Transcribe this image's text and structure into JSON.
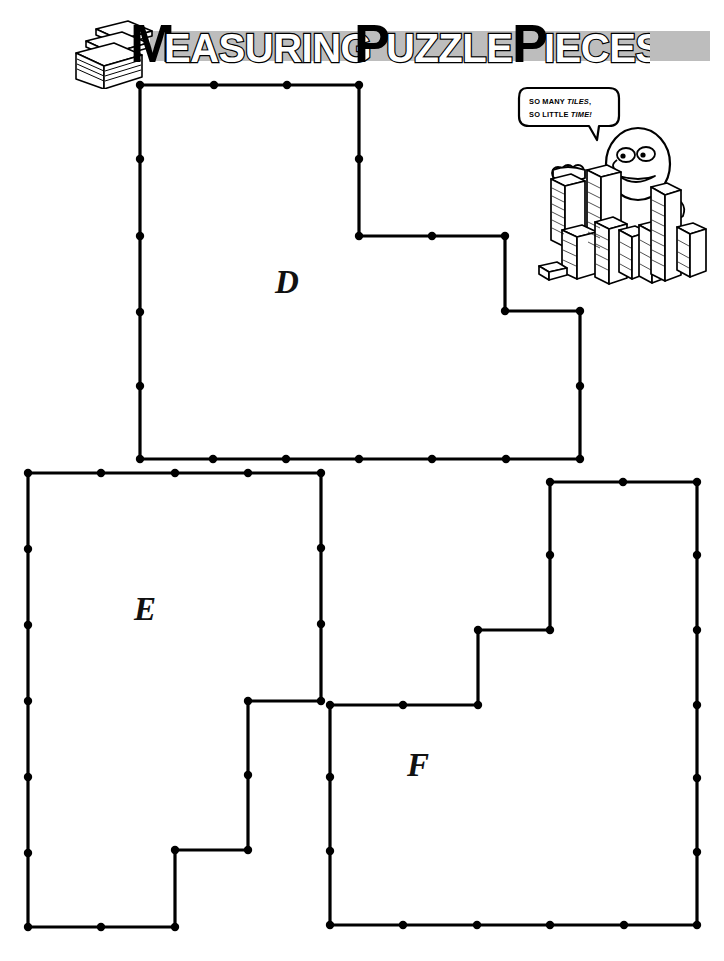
{
  "page": {
    "background_color": "#ffffff",
    "ink_color": "#000000",
    "band_color": "#bdbdbd",
    "width": 724,
    "height": 961
  },
  "header": {
    "title_words": [
      {
        "cap": "M",
        "rest": "EASURING"
      },
      {
        "cap": "P",
        "rest": "UZZLE"
      },
      {
        "cap": "P",
        "rest": "IECES"
      }
    ],
    "title_plain": "MEASURING PUZZLE PIECES",
    "logo_icon": "stack-of-tiles-icon"
  },
  "cartoon": {
    "speech_line1_plain": "SO MANY TILES,",
    "speech_line2_plain": "SO LITTLE TIME!",
    "speech_line1": {
      "a": "SO MANY ",
      "b": "TILES",
      "c": ","
    },
    "speech_line2": {
      "a": "SO LITTLE ",
      "b": "TIME!",
      "c": ""
    },
    "character_icon": "cartoon-character-with-tile-stacks"
  },
  "grid": {
    "unit_px": 73.3,
    "dot_radius": 4.2
  },
  "shapes": [
    {
      "id": "D",
      "label": "D",
      "label_x": 287,
      "label_y": 285,
      "points": [
        [
          140,
          85
        ],
        [
          359,
          85
        ],
        [
          359,
          236
        ],
        [
          505,
          236
        ],
        [
          505,
          311
        ],
        [
          580,
          311
        ],
        [
          580,
          459
        ],
        [
          140,
          459
        ]
      ],
      "dots": [
        [
          140,
          85
        ],
        [
          214,
          85
        ],
        [
          287,
          85
        ],
        [
          359,
          85
        ],
        [
          359,
          159
        ],
        [
          359,
          236
        ],
        [
          432,
          236
        ],
        [
          505,
          236
        ],
        [
          505,
          311
        ],
        [
          580,
          311
        ],
        [
          580,
          386
        ],
        [
          580,
          459
        ],
        [
          506,
          459
        ],
        [
          432,
          459
        ],
        [
          359,
          459
        ],
        [
          286,
          459
        ],
        [
          213,
          459
        ],
        [
          140,
          459
        ],
        [
          140,
          386
        ],
        [
          140,
          312
        ],
        [
          140,
          236
        ],
        [
          140,
          159
        ]
      ]
    },
    {
      "id": "E",
      "label": "E",
      "label_x": 145,
      "label_y": 612,
      "points": [
        [
          28,
          473
        ],
        [
          321,
          473
        ],
        [
          321,
          701
        ],
        [
          248,
          701
        ],
        [
          248,
          850
        ],
        [
          175,
          850
        ],
        [
          175,
          927
        ],
        [
          28,
          927
        ]
      ],
      "dots": [
        [
          28,
          473
        ],
        [
          101,
          473
        ],
        [
          175,
          473
        ],
        [
          248,
          473
        ],
        [
          321,
          473
        ],
        [
          321,
          548
        ],
        [
          321,
          624
        ],
        [
          321,
          701
        ],
        [
          248,
          701
        ],
        [
          248,
          775
        ],
        [
          248,
          850
        ],
        [
          175,
          850
        ],
        [
          175,
          927
        ],
        [
          101,
          927
        ],
        [
          28,
          927
        ],
        [
          28,
          853
        ],
        [
          28,
          777
        ],
        [
          28,
          701
        ],
        [
          28,
          625
        ],
        [
          28,
          549
        ]
      ]
    },
    {
      "id": "F",
      "label": "F",
      "label_x": 418,
      "label_y": 768,
      "points": [
        [
          550,
          482
        ],
        [
          697,
          482
        ],
        [
          697,
          925
        ],
        [
          330,
          925
        ],
        [
          330,
          705
        ],
        [
          478,
          705
        ],
        [
          478,
          630
        ],
        [
          550,
          630
        ]
      ],
      "dots": [
        [
          550,
          482
        ],
        [
          623,
          482
        ],
        [
          697,
          482
        ],
        [
          697,
          555
        ],
        [
          697,
          630
        ],
        [
          697,
          705
        ],
        [
          697,
          778
        ],
        [
          697,
          852
        ],
        [
          697,
          925
        ],
        [
          624,
          925
        ],
        [
          550,
          925
        ],
        [
          477,
          925
        ],
        [
          403,
          925
        ],
        [
          330,
          925
        ],
        [
          330,
          851
        ],
        [
          330,
          777
        ],
        [
          330,
          705
        ],
        [
          403,
          705
        ],
        [
          478,
          705
        ],
        [
          478,
          630
        ],
        [
          550,
          630
        ],
        [
          550,
          555
        ]
      ]
    }
  ]
}
